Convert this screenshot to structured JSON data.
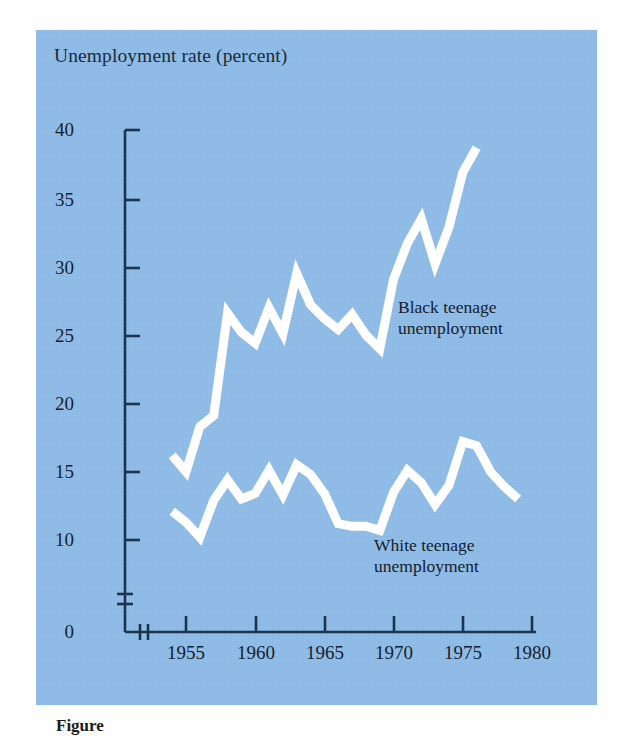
{
  "figure": {
    "title": "Unemployment rate (percent)",
    "caption": "Figure",
    "panel_color": "#8ebae6",
    "line_color": "#ffffff",
    "axis_color": "#1b3550"
  },
  "annotations": [
    {
      "name": "black-series-label",
      "line1": "Black teenage",
      "line2": "unemployment"
    },
    {
      "name": "white-series-label",
      "line1": "White teenage",
      "line2": "unemployment"
    }
  ],
  "axes": {
    "y_ticks": [
      "0",
      "10",
      "15",
      "20",
      "25",
      "30",
      "35",
      "40"
    ],
    "x_ticks": [
      "1955",
      "1960",
      "1965",
      "1970",
      "1975",
      "1980"
    ],
    "y_break": true,
    "x_break": true
  },
  "chart_data": {
    "type": "line",
    "title": "Unemployment rate (percent)",
    "xlabel": "",
    "ylabel": "Unemployment rate (percent)",
    "xlim": [
      1953,
      1980
    ],
    "ylim": [
      10,
      40
    ],
    "y_break_below": 10,
    "grid": false,
    "legend": "inline-annotations",
    "x": [
      1954,
      1955,
      1956,
      1957,
      1958,
      1959,
      1960,
      1961,
      1962,
      1963,
      1964,
      1965,
      1966,
      1967,
      1968,
      1969,
      1970,
      1971,
      1972,
      1973,
      1974,
      1975,
      1976,
      1977,
      1978,
      1979
    ],
    "series": [
      {
        "name": "Black teenage unemployment",
        "values": [
          16.2,
          15.0,
          18.3,
          19.1,
          26.6,
          25.2,
          24.4,
          27.0,
          25.1,
          29.5,
          27.2,
          26.2,
          25.4,
          26.5,
          25.0,
          24.0,
          29.1,
          31.7,
          33.5,
          30.2,
          32.9,
          36.9,
          38.7,
          null,
          null,
          null
        ]
      },
      {
        "name": "White teenage unemployment",
        "values": [
          12.1,
          11.3,
          10.2,
          12.9,
          14.4,
          13.0,
          13.4,
          15.1,
          13.3,
          15.5,
          14.8,
          13.4,
          11.2,
          11.0,
          11.0,
          10.7,
          13.5,
          15.1,
          14.2,
          12.6,
          14.0,
          17.2,
          16.9,
          15.0,
          13.9,
          13.0
        ]
      }
    ]
  }
}
